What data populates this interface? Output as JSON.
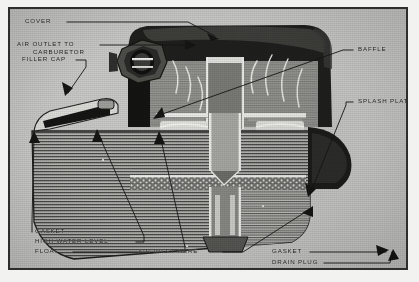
{
  "figure": {
    "kind": "halftone-photo-cutaway",
    "plate_background": "#c9c9c7",
    "frame_color": "#2e2e2e",
    "ink_color": "#1b1b1b"
  },
  "callouts": {
    "cover": "COVER",
    "air_outlet_line1": "AIR OUTLET TO",
    "air_outlet_line2": "CARBURETOR",
    "filler_cap": "FILLER CAP",
    "baffle": "BAFFLE",
    "splash_plate": "SPLASH PLATE",
    "gasket_left": "GASKET",
    "high_water_level": "HIGH WATER LEVEL",
    "float": "FLOAT",
    "air_inlet_here": "AIR INLET HERE",
    "gasket_right": "GASKET",
    "drain_plug": "DRAIN PLUG"
  }
}
